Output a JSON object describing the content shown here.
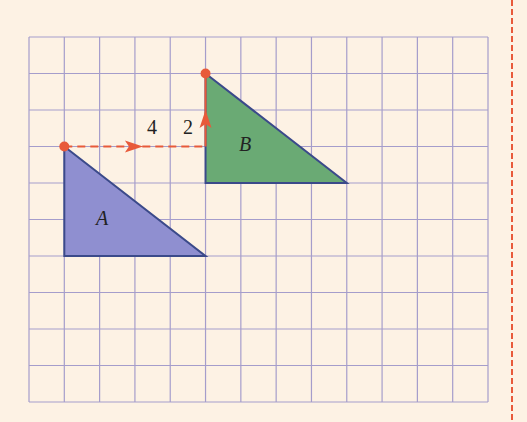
{
  "diagram": {
    "type": "translation-grid",
    "grid": {
      "columns": 13,
      "rows": 10,
      "line_color": "#a59dcb",
      "background": "#fdf2e4"
    },
    "shapes": [
      {
        "label": "A",
        "fill": "#8f8fd0",
        "stroke": "#3b4a8a",
        "vertices_grid": [
          [
            1,
            3
          ],
          [
            1,
            6
          ],
          [
            5,
            6
          ]
        ]
      },
      {
        "label": "B",
        "fill": "#6aaa74",
        "stroke": "#3b4a8a",
        "vertices_grid": [
          [
            5,
            1
          ],
          [
            5,
            4
          ],
          [
            9,
            4
          ]
        ]
      }
    ],
    "translation": {
      "horizontal_label": "4",
      "vertical_label": "2",
      "color": "#e85a3a"
    },
    "margin_line_color": "#e85a3a"
  }
}
